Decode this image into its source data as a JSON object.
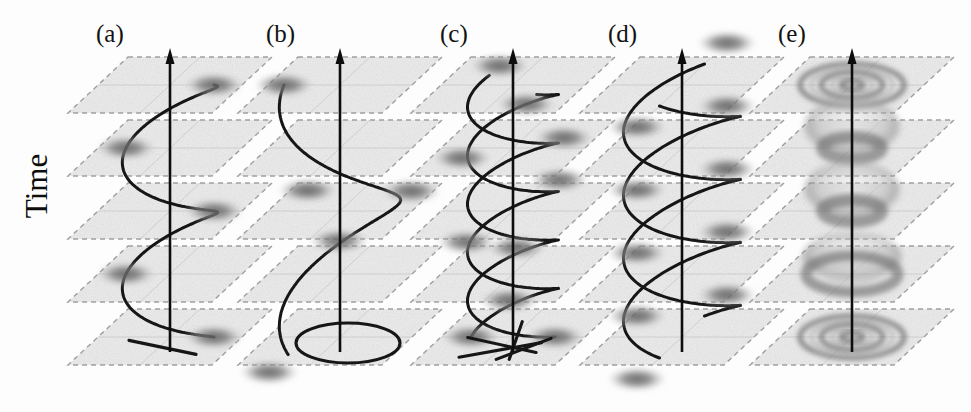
{
  "figure": {
    "axis_title": "Time",
    "background_color": "#fdfdfd",
    "width": 971,
    "height": 412,
    "n_panels": 5,
    "n_time_slices": 5,
    "plane_fill": "#e9e9e9",
    "plane_border": "#9a9a9a",
    "blob_color": "#6e6e6e",
    "trajectory_color": "#161616",
    "axis_color": "#0d0d0d"
  },
  "panels": [
    {
      "label": "(a)",
      "label_x": 96,
      "label_y": 20,
      "axis_x": 170,
      "kind": "single-helix",
      "turns": 2.0,
      "radius": 44,
      "phase": 0.0,
      "blobs_per_plane": 1,
      "bottom_marker": "straight-line",
      "description": "single wave packet on a tight helical orbit"
    },
    {
      "label": "(b)",
      "label_x": 266,
      "label_y": 20,
      "axis_x": 340,
      "kind": "single-helix",
      "turns": 1.15,
      "radius": 56,
      "phase": 0.35,
      "blobs_per_plane": 1,
      "bottom_marker": "closed-ellipse",
      "description": "single wave packet on a wide slow helical orbit closing into an ellipse"
    },
    {
      "label": "(c)",
      "label_x": 440,
      "label_y": 20,
      "axis_x": 513,
      "kind": "double-helix",
      "turns": 2.6,
      "radius": 42,
      "phase": 0.0,
      "blobs_per_plane": 2,
      "bottom_marker": "crossed-lines",
      "description": "two counter-phased wave packets, intertwined helices"
    },
    {
      "label": "(d)",
      "label_x": 608,
      "label_y": 20,
      "axis_x": 682,
      "kind": "double-helix",
      "turns": 2.0,
      "radius": 54,
      "phase": 0.25,
      "blobs_per_plane": 2,
      "bottom_marker": "none",
      "description": "two counter-phased wave packets crossing on the axis"
    },
    {
      "label": "(e)",
      "label_x": 778,
      "label_y": 20,
      "axis_x": 852,
      "kind": "radial-rings",
      "turns": 0,
      "radius": 0,
      "phase": 0,
      "blobs_per_plane": 0,
      "bottom_marker": "none",
      "ring_pattern": [
        "bullseye",
        "torus",
        "shell",
        "shell",
        "bullseye"
      ],
      "description": "radially breathing wave packet forming concentric ring and shell structures"
    }
  ],
  "time_slices": [
    {
      "index": 0,
      "y": 85
    },
    {
      "index": 1,
      "y": 148
    },
    {
      "index": 2,
      "y": 211
    },
    {
      "index": 3,
      "y": 274
    },
    {
      "index": 4,
      "y": 337
    }
  ],
  "plane_geometry": {
    "half_width": 72,
    "half_depth": 28,
    "skew_x": 30,
    "grid_cells": 2
  },
  "arrow": {
    "tip_y": 48,
    "base_y": 352,
    "head_width": 9,
    "head_height": 16
  },
  "chart_data": {
    "type": "scatter",
    "title": "",
    "xlabel": "",
    "ylabel": "Time",
    "legend": [],
    "series": [
      {
        "name": "(a) single helix",
        "values": [
          0.0,
          0.5,
          1.0,
          1.5,
          2.0
        ]
      },
      {
        "name": "(b) wide helix",
        "values": [
          0.35,
          0.64,
          0.92,
          1.21,
          1.5
        ]
      },
      {
        "name": "(c) double helix",
        "values": [
          0.0,
          0.65,
          1.3,
          1.95,
          2.6
        ]
      },
      {
        "name": "(d) double helix tight",
        "values": [
          0.25,
          0.75,
          1.25,
          1.75,
          2.25
        ]
      },
      {
        "name": "(e) radial breathing",
        "values": [
          0,
          1,
          2,
          3,
          4
        ]
      }
    ],
    "categories": [
      "t1",
      "t2",
      "t3",
      "t4",
      "t5"
    ]
  }
}
